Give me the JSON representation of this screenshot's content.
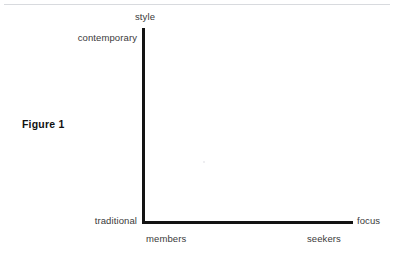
{
  "figure": {
    "caption": "Figure 1",
    "background_color": "#ffffff",
    "axis_color": "#131313",
    "label_color": "#3a3a3a",
    "rule_color": "#d8dade"
  },
  "chart_data": {
    "type": "scatter",
    "title": "Figure 1",
    "subtitle": "",
    "xlabel": "focus",
    "ylabel": "style",
    "x_axis": {
      "name": "focus",
      "left_pole": "members",
      "right_pole": "seekers",
      "tick_labels": [
        "members",
        "seekers"
      ]
    },
    "y_axis": {
      "name": "style",
      "bottom_pole": "traditional",
      "top_pole": "contemporary",
      "tick_labels": [
        "traditional",
        "contemporary"
      ]
    },
    "categories": [],
    "values": [],
    "series": [],
    "annotations": [],
    "grid": false,
    "legend": false,
    "legend_position": "none"
  },
  "axes": {
    "y_axis_top_label": "style",
    "y_axis_high_label": "contemporary",
    "y_axis_low_label": "traditional",
    "x_axis_end_label": "focus",
    "x_axis_left_label": "members",
    "x_axis_right_label": "seekers"
  }
}
